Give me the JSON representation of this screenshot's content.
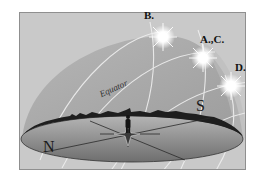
{
  "diagram": {
    "type": "celestial-sphere-sun-paths",
    "sun_positions": [
      {
        "id": "B",
        "label": "B."
      },
      {
        "id": "AC",
        "label": "A.,C."
      },
      {
        "id": "D",
        "label": "D."
      }
    ],
    "directions": {
      "north": "N",
      "south": "S"
    },
    "equator_label": "Equator",
    "colors": {
      "background": "#c9c9c9",
      "dome": "#a8a8a8",
      "ground": "#8c8c8c",
      "horizon_edge": "#1e1e1e",
      "sun_paths": "#efefef",
      "frame_border": "#8f8f8f"
    },
    "elements": {
      "observer": "standing-figure",
      "compass_rose": "ground-star",
      "horizon_silhouette": "treeline"
    }
  }
}
